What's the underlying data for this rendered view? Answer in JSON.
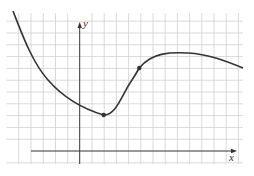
{
  "figure": {
    "x_axis_label": "x",
    "y_axis_label": "y",
    "colors": {
      "grid": "#cfcfcf",
      "axis": "#333333",
      "curve": "#333333",
      "background": "#ffffff"
    },
    "grid": {
      "x0": 6.5,
      "x1": 243,
      "y0": 13,
      "y1": 164,
      "x_lines": [
        18.7,
        31,
        43.3,
        55.5,
        67.7,
        92,
        104.2,
        116.4,
        128.6,
        140.8,
        153,
        165.2,
        177.4,
        189.6,
        201.8,
        214,
        226.2,
        238.4
      ],
      "y_lines": [
        21.2,
        33,
        44.8,
        56.6,
        68.4,
        80.2,
        92,
        103.8,
        115.6,
        127.4,
        139.2,
        162.8
      ]
    },
    "axes": {
      "origin": [
        79.7,
        151
      ],
      "x_axis_start": 31,
      "x_axis_end": 237,
      "y_axis_top": 22,
      "y_axis_bottom": 164
    },
    "marked_points": [
      {
        "name": "local-minimum",
        "x": 103.7,
        "y": 115
      },
      {
        "name": "point-on-curve",
        "x": 139.3,
        "y": 68
      }
    ],
    "curve_path": "M 13 11 C 22 34, 32 62, 48 80 C 62 96, 80 108, 103.7 115 C 116 116, 122 94, 132 80 C 136 74, 138 70, 139.3 68 C 152 52, 172 52, 188 53 C 208 54, 226 61, 243 68"
  }
}
